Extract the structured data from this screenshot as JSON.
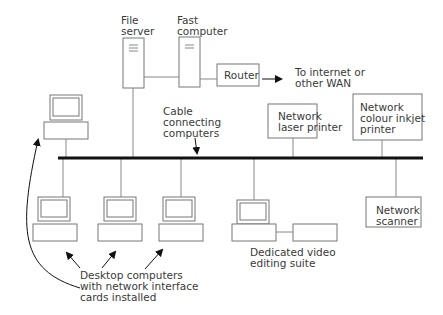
{
  "labels": {
    "file_server": "File\nserver",
    "fast_computer": "Fast\ncomputer",
    "router": "Router",
    "wan": "To internet or\nother WAN",
    "cable": "Cable\nconnecting\ncomputers",
    "laser_printer": "Network\nlaser printer",
    "inkjet_printer": "Network\ncolour inkjet\nprinter",
    "scanner": "Network\nscanner",
    "video_suite": "Dedicated video\nediting suite",
    "desktops": "Desktop computers\nwith network interface\ncards installed"
  },
  "colors": {
    "line": "#777777",
    "bus": "#111111",
    "text": "#3a3a3a"
  }
}
